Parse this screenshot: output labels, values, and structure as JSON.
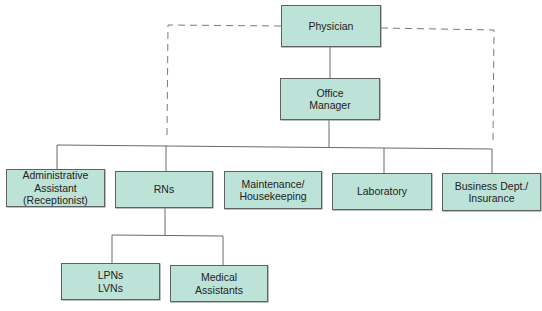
{
  "diagram": {
    "type": "org-chart",
    "colors": {
      "box_fill": "#bde2d8",
      "box_border": "#5c6360",
      "line": "#6a6a6a",
      "dashed_line": "#7a7a7a"
    },
    "nodes": {
      "physician": {
        "label": "Physician",
        "level": 0
      },
      "office_manager": {
        "label": "Office\nManager",
        "level": 1,
        "reports_to": "Physician"
      },
      "admin_assistant": {
        "label": "Administrative\nAssistant\n(Receptionist)",
        "level": 2,
        "reports_to": "Office Manager"
      },
      "rns": {
        "label": "RNs",
        "level": 2,
        "reports_to": "Office Manager"
      },
      "maintenance": {
        "label": "Maintenance/\nHousekeeping",
        "level": 2,
        "reports_to": "Office Manager"
      },
      "laboratory": {
        "label": "Laboratory",
        "level": 2,
        "reports_to": "Office Manager"
      },
      "business": {
        "label": "Business Dept./\nInsurance",
        "level": 2,
        "reports_to": "Office Manager"
      },
      "lpns": {
        "label": "LPNs\nLVNs",
        "level": 3,
        "reports_to": "RNs"
      },
      "medical_assistants": {
        "label": "Medical\nAssistants",
        "level": 3,
        "reports_to": "RNs"
      }
    },
    "dashed_links": [
      {
        "from": "Physician",
        "to": "Administrative Assistant (Receptionist)",
        "style": "dashed"
      },
      {
        "from": "Physician",
        "to": "Business Dept./Insurance",
        "style": "dashed"
      }
    ]
  }
}
